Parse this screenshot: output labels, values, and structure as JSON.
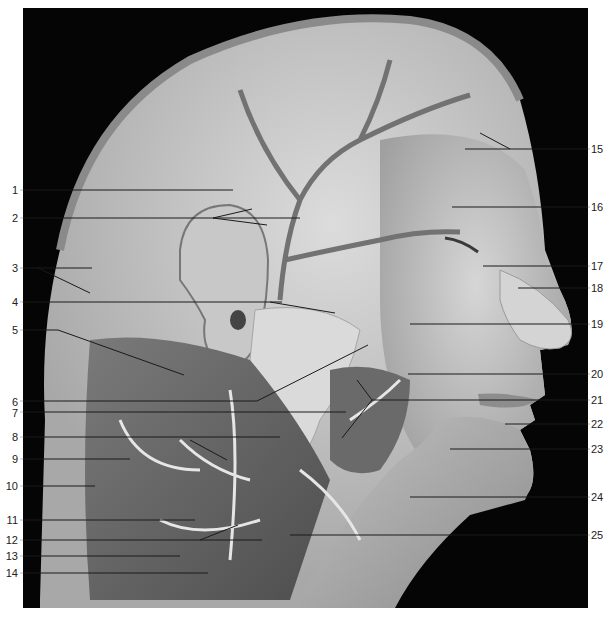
{
  "figure": {
    "colors": {
      "background": "#ffffff",
      "photo_background": "#050505",
      "tissue_light": "#cfcfcf",
      "tissue_mid": "#9a9a9a",
      "tissue_dark": "#5e5e5e",
      "vessel": "#6d6d6d",
      "nerve": "#e4e4e4",
      "leader_on_tissue": "#1a1a1a",
      "leader_on_black": "#bdbdbd",
      "label_text": "#222222"
    },
    "labels_left": [
      {
        "num": "1"
      },
      {
        "num": "2"
      },
      {
        "num": "3"
      },
      {
        "num": "4"
      },
      {
        "num": "5"
      },
      {
        "num": "6"
      },
      {
        "num": "7"
      },
      {
        "num": "8"
      },
      {
        "num": "9"
      },
      {
        "num": "10"
      },
      {
        "num": "11"
      },
      {
        "num": "12"
      },
      {
        "num": "13"
      },
      {
        "num": "14"
      }
    ],
    "labels_right": [
      {
        "num": "15"
      },
      {
        "num": "16"
      },
      {
        "num": "17"
      },
      {
        "num": "18"
      },
      {
        "num": "19"
      },
      {
        "num": "20"
      },
      {
        "num": "21"
      },
      {
        "num": "22"
      },
      {
        "num": "23"
      },
      {
        "num": "24"
      },
      {
        "num": "25"
      }
    ]
  }
}
